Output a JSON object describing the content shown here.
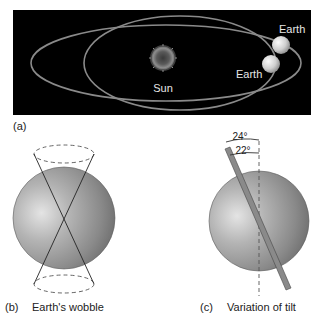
{
  "panel_a": {
    "label": "(a)",
    "sun_label": "Sun",
    "earth_label_1": "Earth",
    "earth_label_2": "Earth"
  },
  "panel_b": {
    "label": "(b)",
    "caption": "Earth's wobble"
  },
  "panel_c": {
    "label": "(c)",
    "caption": "Variation of tilt",
    "angle_max": "24°",
    "angle_min": "22°"
  },
  "colors": {
    "background": "#ffffff",
    "space": "#000000",
    "orbit": "#8a8a8a",
    "sphere_light": "#d6d6d6",
    "sphere_dark": "#6e6e6e",
    "text_dark": "#222222",
    "text_light": "#e6e6e6"
  }
}
